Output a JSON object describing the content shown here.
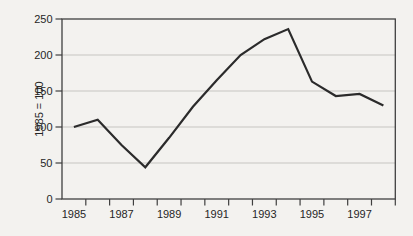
{
  "page": {
    "background": "#f3f2ef"
  },
  "chart_data": {
    "type": "line",
    "x": [
      1985,
      1986,
      1987,
      1988,
      1989,
      1990,
      1991,
      1992,
      1993,
      1994,
      1995,
      1996,
      1997,
      1998
    ],
    "series": [
      {
        "name": "index",
        "values": [
          100,
          110,
          75,
          44,
          85,
          128,
          165,
          200,
          222,
          236,
          163,
          143,
          146,
          130
        ]
      }
    ],
    "title": "",
    "xlabel": "",
    "ylabel": "1985 = 100",
    "ylim": [
      0,
      250
    ],
    "yticks": [
      0,
      50,
      100,
      150,
      200,
      250
    ],
    "xtick_labels": [
      "1985",
      "1987",
      "1989",
      "1991",
      "1993",
      "1995",
      "1997"
    ],
    "grid": "horizontal",
    "legend": "none",
    "colors": {
      "line": "#2b2b2b",
      "frame": "#3f3f3f",
      "gridline": "#c6c5c1",
      "text": "#262626"
    },
    "layout": {
      "plot_left": 62,
      "plot_top": 19,
      "plot_right": 395.3,
      "plot_bottom": 199,
      "x_ticks_count": 14
    }
  }
}
